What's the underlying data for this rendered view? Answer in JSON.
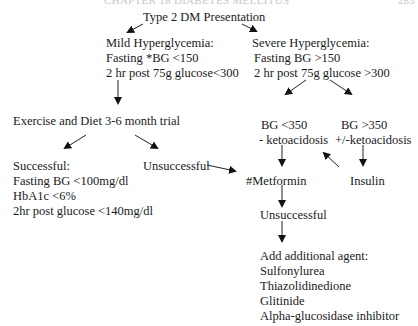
{
  "header_fragment": "CHAPTER 18 DIABETES MELLITUS",
  "header_page": "283",
  "root": {
    "title": "Type 2 DM Presentation"
  },
  "mild": {
    "title": "Mild Hyperglycemia:",
    "line1": "Fasting *BG <150",
    "line2": "2 hr post 75g glucose<300"
  },
  "severe": {
    "title": "Severe Hyperglycemia:",
    "line1": "Fasting BG >150",
    "line2": "2 hr post 75g glucose >300"
  },
  "exercise": {
    "title": "Exercise and Diet 3-6 month trial"
  },
  "successful": {
    "title": "Successful:",
    "line1": "Fasting BG <100mg/dl",
    "line2": "HbA1c <6%",
    "line3": "2hr post glucose <140mg/dl"
  },
  "unsuccessful_trial": {
    "title": "Unsuccessful"
  },
  "bg_low": {
    "line1": "BG <350",
    "line2": "- ketoacidosis"
  },
  "bg_high": {
    "line1": "BG >350",
    "line2": "+/-ketoacidosis"
  },
  "metformin": {
    "title": "#Metformin"
  },
  "insulin": {
    "title": "Insulin"
  },
  "unsuccessful_metformin": {
    "title": "Unsuccessful"
  },
  "additional": {
    "title": "Add additional agent:",
    "agents": [
      "Sulfonylurea",
      "Thiazolidinedione",
      "Glitinide",
      "Alpha-glucosidase inhibitor"
    ]
  }
}
